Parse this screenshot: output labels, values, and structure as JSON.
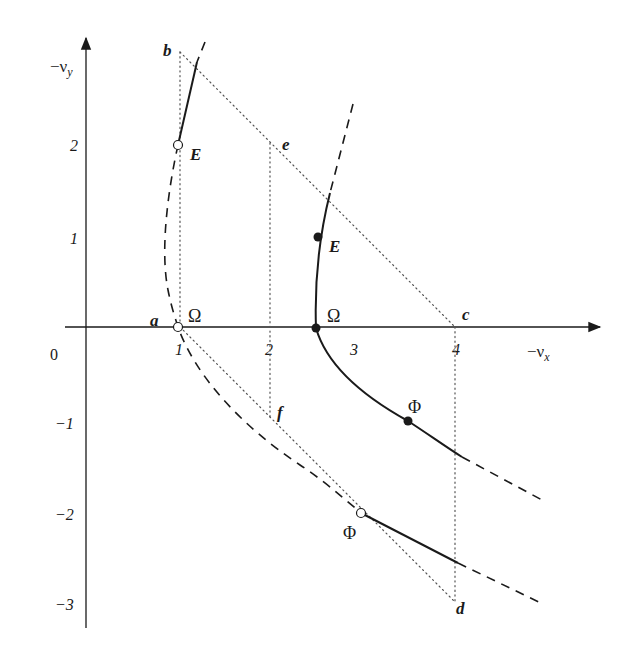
{
  "figure": {
    "width": 617,
    "height": 655,
    "colors": {
      "ink": "#1a1a1a",
      "dotted": "#555555",
      "background": "#ffffff"
    },
    "axes": {
      "origin_px": [
        86,
        327
      ],
      "x_axis": {
        "from": [
          65,
          327
        ],
        "to": [
          600,
          327
        ],
        "label": "−ν",
        "label_sub": "x",
        "label_pos": [
          527,
          357
        ]
      },
      "y_axis": {
        "from": [
          86,
          628
        ],
        "to": [
          86,
          38
        ],
        "label": "−ν",
        "label_sub": "y",
        "label_pos": [
          50,
          72
        ]
      },
      "origin_label": {
        "text": "0",
        "pos": [
          50,
          360
        ]
      },
      "x_ticks": [
        {
          "text": "1",
          "pos": [
            175,
            355
          ]
        },
        {
          "text": "2",
          "pos": [
            265,
            355
          ]
        },
        {
          "text": "3",
          "pos": [
            350,
            355
          ]
        },
        {
          "text": "4",
          "pos": [
            452,
            355
          ]
        }
      ],
      "y_ticks": [
        {
          "text": "2",
          "pos": [
            70,
            151
          ]
        },
        {
          "text": "1",
          "pos": [
            70,
            244
          ]
        },
        {
          "text": "−1",
          "pos": [
            55,
            429
          ]
        },
        {
          "text": "−2",
          "pos": [
            55,
            520
          ]
        },
        {
          "text": "−3",
          "pos": [
            55,
            610
          ]
        }
      ]
    },
    "point_labels": [
      {
        "text": "a",
        "pos": [
          150,
          326
        ]
      },
      {
        "text": "b",
        "pos": [
          163,
          56
        ]
      },
      {
        "text": "c",
        "pos": [
          462,
          320
        ]
      },
      {
        "text": "d",
        "pos": [
          456,
          614
        ]
      },
      {
        "text": "e",
        "pos": [
          282,
          150
        ]
      },
      {
        "text": "f",
        "pos": [
          277,
          418
        ]
      },
      {
        "text": "E",
        "pos": [
          190,
          160
        ]
      },
      {
        "text": "E",
        "pos": [
          329,
          252
        ]
      }
    ],
    "greek_labels": [
      {
        "text": "Ω",
        "pos": [
          188,
          322
        ]
      },
      {
        "text": "Ω",
        "pos": [
          327,
          322
        ]
      },
      {
        "text": "Φ",
        "pos": [
          408,
          413
        ]
      },
      {
        "text": "Φ",
        "pos": [
          343,
          539
        ]
      }
    ],
    "dotted_lines": [
      {
        "name": "b-to-a-vertical",
        "points": [
          [
            180,
            52
          ],
          [
            180,
            327
          ]
        ]
      },
      {
        "name": "b-to-c-diagonal",
        "points": [
          [
            180,
            52
          ],
          [
            455,
            327
          ]
        ]
      },
      {
        "name": "e-to-f-vertical",
        "points": [
          [
            270,
            143
          ],
          [
            270,
            420
          ]
        ]
      },
      {
        "name": "a-to-d-diagonal",
        "points": [
          [
            180,
            327
          ],
          [
            455,
            602
          ]
        ]
      },
      {
        "name": "c-to-d-vertical",
        "points": [
          [
            455,
            327
          ],
          [
            455,
            602
          ]
        ]
      }
    ],
    "curves": {
      "left_branch_dashed": "M205,42 L197,62 M178,145 C168,190 160,250 168,290 C172,310 176,320 178,327 C195,375 240,425 300,465 C320,478 340,495 361,513",
      "left_branch_solid_top": "M197,62 L178,145",
      "right_branch_dashed_top": "M353,104 L330,193",
      "right_branch_solid": "M330,193 C322,225 314,270 316,328 C328,370 370,400 408,421 C428,434 446,447 462,457",
      "right_branch_dashed_bottom": "M462,457 L542,500",
      "lower_solid": "M361,513 L458,563",
      "lower_dashed": "M458,563 L543,604"
    },
    "markers": {
      "open": [
        {
          "name": "E-open",
          "pos": [
            178,
            145
          ]
        },
        {
          "name": "Omega-open",
          "pos": [
            178,
            327
          ]
        },
        {
          "name": "Phi-open",
          "pos": [
            361,
            513
          ]
        }
      ],
      "filled": [
        {
          "name": "E-filled",
          "pos": [
            318,
            237
          ]
        },
        {
          "name": "Omega-filled",
          "pos": [
            316,
            328
          ]
        },
        {
          "name": "Phi-filled",
          "pos": [
            408,
            421
          ]
        }
      ]
    }
  }
}
